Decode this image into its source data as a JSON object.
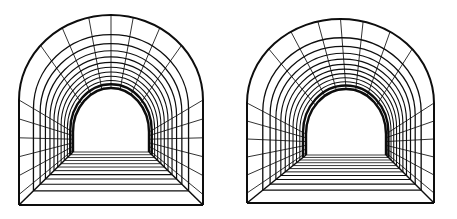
{
  "image": {
    "title": "Two perspective line drawings of arched tunnels",
    "width": 457,
    "height": 219,
    "background_color": "#ffffff",
    "line_color": "#0d0d0d",
    "figure_count": 2,
    "caption": ""
  },
  "figures": [
    {
      "name": "left-tunnel",
      "label": "Left arched tunnel",
      "origin_x": 0,
      "origin_y": 0,
      "width": 228,
      "height": 219,
      "mouth": {
        "left": 19,
        "right": 203,
        "top_of_arc": 15,
        "springline": 100,
        "floor": 205
      },
      "vanish": {
        "cx": 111,
        "cy": 152,
        "half_width": 38,
        "arc_top": 88,
        "springline": 132,
        "floor": 152
      },
      "rib_count": 12,
      "wall_line_count": 12,
      "floor_line_count": 12,
      "stroke_outer": 2.0,
      "stroke_inner": 0.9
    },
    {
      "name": "right-tunnel",
      "label": "Right arched tunnel",
      "origin_x": 229,
      "origin_y": 0,
      "width": 228,
      "height": 219,
      "mouth": {
        "left": 18,
        "right": 205,
        "top_of_arc": 19,
        "springline": 103,
        "floor": 203
      },
      "vanish": {
        "cx": 117,
        "cy": 155,
        "half_width": 40,
        "arc_top": 89,
        "springline": 134,
        "floor": 155
      },
      "rib_count": 12,
      "wall_line_count": 12,
      "floor_line_count": 12,
      "stroke_outer": 2.0,
      "stroke_inner": 0.9
    }
  ]
}
